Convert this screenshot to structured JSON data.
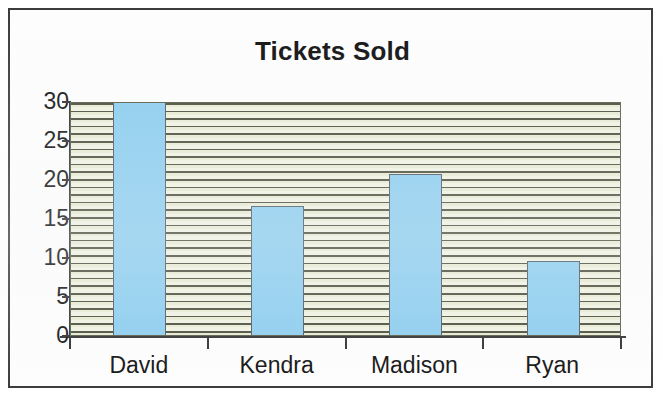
{
  "chart_data": {
    "type": "bar",
    "title": "Tickets Sold",
    "xlabel": "",
    "ylabel": "",
    "categories": [
      "David",
      "Kendra",
      "Madison",
      "Ryan"
    ],
    "values": [
      30,
      16.5,
      20.7,
      9.5
    ],
    "ylim": [
      0,
      30
    ],
    "y_ticks": [
      0,
      5,
      10,
      15,
      20,
      25,
      30
    ],
    "y_tick_labels": [
      "0",
      "5",
      "10",
      "15",
      "20",
      "25",
      "30"
    ],
    "grid": "horizontal-stripe-pattern",
    "legend": "none",
    "bar_color": "#8ccdee",
    "bar_border_color": "#4d5a63",
    "plot_background_color": "#e6eacf",
    "plot_stripe_color": "#4a4c3a",
    "axis_color": "#2f2f30",
    "text_color": "#111111",
    "frame_border_color": "#3a3a3c"
  }
}
